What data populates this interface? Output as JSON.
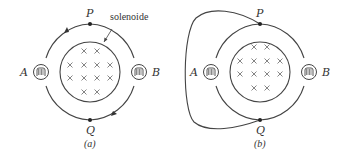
{
  "figure_a": {
    "caption": "(a)",
    "labels": {
      "top": "P",
      "bottom": "Q",
      "left": "A",
      "right": "B"
    },
    "annotation": "solenoide",
    "field_symbol": "×",
    "field_rows": [
      2,
      4,
      4,
      2
    ],
    "circuit": "single loop through bulbs A and B, arrows indicating circulation"
  },
  "figure_b": {
    "caption": "(b)",
    "labels": {
      "top": "P",
      "bottom": "Q",
      "left": "A",
      "right": "B"
    },
    "field_symbol": "×",
    "field_rows": [
      2,
      4,
      4,
      2
    ],
    "circuit": "loop with extra wire connecting P and Q around the left side"
  }
}
